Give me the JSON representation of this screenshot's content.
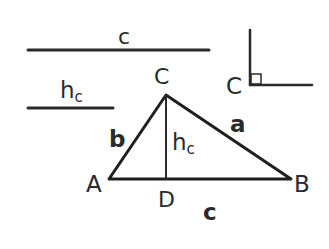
{
  "segments": {
    "c_label": "c",
    "hc_label_main": "h",
    "hc_label_sub": "c"
  },
  "triangle": {
    "vertices": {
      "A": "A",
      "B": "B",
      "C": "C",
      "D": "D"
    },
    "sides": {
      "a": "a",
      "b": "b",
      "c": "c"
    },
    "altitude_main": "h",
    "altitude_sub": "c"
  },
  "right_angle": {
    "vertex_label": "C"
  },
  "colors": {
    "ink": "#2a2a2a",
    "background": "#ffffff"
  }
}
